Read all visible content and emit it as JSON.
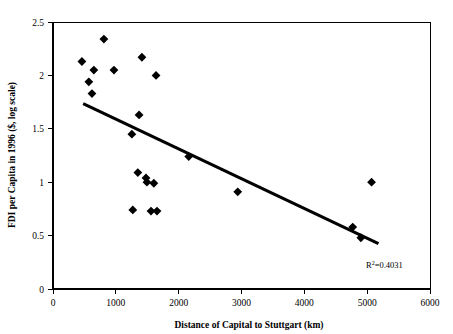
{
  "chart_data": {
    "type": "scatter",
    "title": "",
    "xlabel": "Distance of Capital to Stuttgart (km)",
    "ylabel": "FDI per Capita in 1996 ($, log scale)",
    "xlim": [
      0,
      6000
    ],
    "ylim": [
      0,
      2.5
    ],
    "xticks": [
      0,
      1000,
      2000,
      3000,
      4000,
      5000,
      6000
    ],
    "xtick_labels": [
      "0",
      "1000",
      "2000",
      "3000",
      "4000",
      "5000",
      "6000"
    ],
    "yticks": [
      0,
      0.5,
      1,
      1.5,
      2,
      2.5
    ],
    "ytick_labels": [
      "0",
      "0.5",
      "1",
      "1.5",
      "2",
      "2.5"
    ],
    "grid": false,
    "legend": false,
    "marker": "diamond",
    "marker_color": "#000000",
    "points": [
      {
        "x": 810,
        "y": 2.34
      },
      {
        "x": 460,
        "y": 2.13
      },
      {
        "x": 1415,
        "y": 2.17
      },
      {
        "x": 650,
        "y": 2.05
      },
      {
        "x": 970,
        "y": 2.05
      },
      {
        "x": 1640,
        "y": 2.0
      },
      {
        "x": 570,
        "y": 1.94
      },
      {
        "x": 620,
        "y": 1.83
      },
      {
        "x": 1370,
        "y": 1.63
      },
      {
        "x": 1255,
        "y": 1.45
      },
      {
        "x": 2160,
        "y": 1.24
      },
      {
        "x": 1350,
        "y": 1.09
      },
      {
        "x": 1480,
        "y": 1.04
      },
      {
        "x": 1495,
        "y": 1.0
      },
      {
        "x": 1605,
        "y": 0.99
      },
      {
        "x": 5070,
        "y": 1.0
      },
      {
        "x": 2940,
        "y": 0.91
      },
      {
        "x": 1270,
        "y": 0.74
      },
      {
        "x": 1560,
        "y": 0.73
      },
      {
        "x": 1655,
        "y": 0.73
      },
      {
        "x": 4770,
        "y": 0.58
      },
      {
        "x": 4900,
        "y": 0.48
      }
    ],
    "trendline": {
      "type": "linear",
      "x_start": 480,
      "y_start": 1.735,
      "x_end": 5180,
      "y_end": 0.425
    },
    "annotations": [
      {
        "name": "r-squared",
        "text_prefix": "R",
        "text_sup": "2",
        "text_suffix": "=0.4031",
        "full_text": "R2=0.4031",
        "x": 5000,
        "y": 0.25
      }
    ]
  },
  "axes": {
    "x_axis_title": "Distance of Capital to Stuttgart (km)",
    "y_axis_title": "FDI per Capita in 1996 ($, log scale)"
  },
  "r_squared": {
    "symbol": "R",
    "exponent": "2",
    "value": "=0.4031"
  }
}
